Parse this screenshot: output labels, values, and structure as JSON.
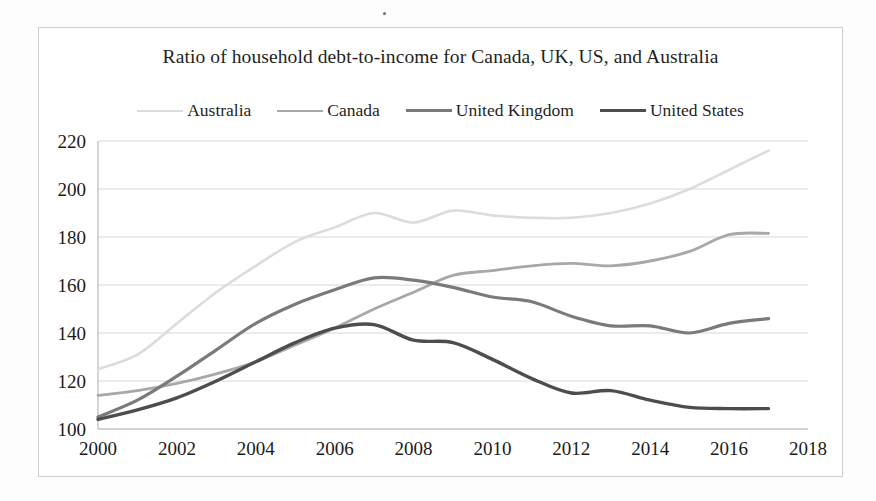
{
  "chart_data": {
    "type": "line",
    "title": "Ratio of household debt-to-income for Canada, UK, US, and Australia",
    "xlabel": "",
    "ylabel": "",
    "xlim": [
      2000,
      2018
    ],
    "ylim": [
      100,
      220
    ],
    "xticks": [
      2000,
      2002,
      2004,
      2006,
      2008,
      2010,
      2012,
      2014,
      2016,
      2018
    ],
    "yticks": [
      100,
      120,
      140,
      160,
      180,
      200,
      220
    ],
    "grid": "horizontal",
    "legend_position": "top-center",
    "x": [
      2000,
      2001,
      2002,
      2003,
      2004,
      2005,
      2006,
      2007,
      2008,
      2009,
      2010,
      2011,
      2012,
      2013,
      2014,
      2015,
      2016,
      2017
    ],
    "series": [
      {
        "name": "Australia",
        "color": "#dcdcdc",
        "width": 2.6,
        "values": [
          125,
          131,
          144,
          157,
          168,
          178,
          184,
          190,
          186,
          191,
          189,
          188,
          188,
          190,
          194,
          200,
          208,
          216
        ]
      },
      {
        "name": "Canada",
        "color": "#a8a8a8",
        "width": 2.8,
        "values": [
          114,
          116,
          119,
          123,
          128,
          135,
          142,
          150,
          157,
          164,
          166,
          168,
          169,
          168,
          170,
          174,
          181,
          181.5
        ]
      },
      {
        "name": "United Kingdom",
        "color": "#7a7a7a",
        "width": 3.2,
        "values": [
          105,
          112,
          122,
          133,
          144,
          152,
          158,
          163,
          162,
          159,
          155,
          153,
          147,
          143,
          143,
          140,
          144,
          146
        ]
      },
      {
        "name": "United States",
        "color": "#4d4d4d",
        "width": 3.4,
        "values": [
          104,
          108,
          113,
          120,
          128,
          136,
          142,
          143.5,
          137,
          136,
          129,
          121,
          115,
          116,
          112,
          109,
          108.5,
          108.5
        ]
      }
    ]
  },
  "legend": {
    "items": [
      {
        "label": "Australia"
      },
      {
        "label": "Canada"
      },
      {
        "label": "United Kingdom"
      },
      {
        "label": "United States"
      }
    ]
  },
  "colors": {
    "australia": "#dcdcdc",
    "canada": "#a8a8a8",
    "united_kingdom": "#7a7a7a",
    "united_states": "#4d4d4d",
    "gridline": "#d8d8d8",
    "axis": "#b9b9b9",
    "frame": "#cfcfcf",
    "text": "#1b1b1b"
  }
}
